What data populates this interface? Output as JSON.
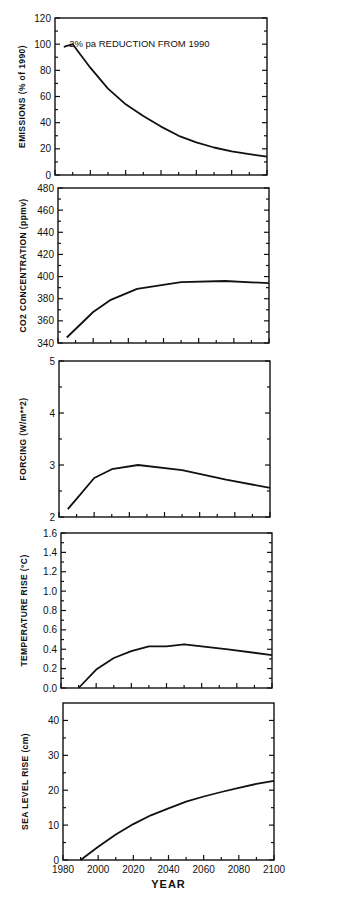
{
  "chart_data": [
    {
      "type": "line",
      "title": "",
      "annotation": "2% pa REDUCTION FROM 1990",
      "xlabel": "",
      "ylabel": "EMISSIONS (% of 1990)",
      "xlim": [
        1980,
        2100
      ],
      "ylim": [
        0,
        120
      ],
      "yticks": [
        0,
        20,
        40,
        60,
        80,
        100,
        120
      ],
      "ytick_labels": [
        "0",
        "20",
        "40",
        "60",
        "80",
        "100",
        "120"
      ],
      "grid": false,
      "series": [
        {
          "name": "Emissions",
          "x": [
            1985,
            1990,
            2000,
            2010,
            2020,
            2030,
            2040,
            2050,
            2060,
            2070,
            2080,
            2090,
            2100
          ],
          "y": [
            98,
            100,
            82,
            66,
            54,
            45,
            37,
            30,
            25,
            21,
            18,
            16,
            14
          ]
        }
      ]
    },
    {
      "type": "line",
      "title": "",
      "xlabel": "",
      "ylabel": "CO2 CONCENTRATION (ppmv)",
      "xlim": [
        1980,
        2100
      ],
      "ylim": [
        340,
        480
      ],
      "yticks": [
        340,
        360,
        380,
        400,
        420,
        440,
        460,
        480
      ],
      "ytick_labels": [
        "340",
        "360",
        "380",
        "400",
        "420",
        "440",
        "460",
        "480"
      ],
      "grid": false,
      "series": [
        {
          "name": "CO2",
          "x": [
            1985,
            2000,
            2010,
            2025,
            2050,
            2075,
            2100
          ],
          "y": [
            345,
            368,
            379,
            389,
            395,
            396,
            394
          ]
        }
      ]
    },
    {
      "type": "line",
      "title": "",
      "xlabel": "",
      "ylabel": "FORCING (W/m**2)",
      "xlim": [
        1980,
        2100
      ],
      "ylim": [
        2,
        5
      ],
      "yticks": [
        2,
        3,
        4,
        5
      ],
      "ytick_labels": [
        "2",
        "3",
        "4",
        "5"
      ],
      "grid": false,
      "series": [
        {
          "name": "Forcing",
          "x": [
            1985,
            1990,
            2000,
            2010,
            2025,
            2050,
            2075,
            2100
          ],
          "y": [
            2.15,
            2.35,
            2.75,
            2.92,
            3.0,
            2.9,
            2.72,
            2.56
          ]
        }
      ]
    },
    {
      "type": "line",
      "title": "",
      "xlabel": "",
      "ylabel": "TEMPERATURE RISE (°C)",
      "xlim": [
        1980,
        2100
      ],
      "ylim": [
        0,
        1.6
      ],
      "yticks": [
        0.0,
        0.2,
        0.4,
        0.6,
        0.8,
        1.0,
        1.2,
        1.4,
        1.6
      ],
      "ytick_labels": [
        "0.0",
        "0.2",
        "0.4",
        "0.6",
        "0.8",
        "1.0",
        "1.2",
        "1.4",
        "1.6"
      ],
      "grid": false,
      "series": [
        {
          "name": "Temperature",
          "x": [
            1990,
            2000,
            2010,
            2020,
            2030,
            2040,
            2050,
            2075,
            2100
          ],
          "y": [
            0.0,
            0.19,
            0.31,
            0.38,
            0.43,
            0.43,
            0.45,
            0.4,
            0.34
          ]
        }
      ]
    },
    {
      "type": "line",
      "title": "",
      "xlabel": "YEAR",
      "ylabel": "SEA LEVEL RISE (cm)",
      "xlim": [
        1980,
        2100
      ],
      "ylim": [
        0,
        45
      ],
      "yticks": [
        0,
        10,
        20,
        30,
        40
      ],
      "ytick_labels": [
        "0",
        "10",
        "20",
        "30",
        "40"
      ],
      "xticks": [
        1980,
        2000,
        2020,
        2040,
        2060,
        2080,
        2100
      ],
      "xtick_labels": [
        "1980",
        "2000",
        "2020",
        "2040",
        "2060",
        "2080",
        "2100"
      ],
      "grid": false,
      "series": [
        {
          "name": "Sea level",
          "x": [
            1990,
            2000,
            2010,
            2020,
            2030,
            2040,
            2050,
            2060,
            2070,
            2080,
            2090,
            2100
          ],
          "y": [
            0.0,
            3.8,
            7.3,
            10.3,
            12.8,
            14.8,
            16.7,
            18.2,
            19.5,
            20.7,
            21.8,
            22.7
          ]
        }
      ]
    }
  ]
}
